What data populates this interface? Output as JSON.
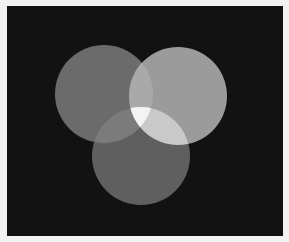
{
  "image": {
    "description": "Three overlapping translucent circles on a black background (grayscale color-mixing diagram)",
    "border_color": "#f2f2f2",
    "background_color": "#121212"
  },
  "panel": {
    "x": 7,
    "y": 6,
    "width": 276,
    "height": 230
  },
  "circles": [
    {
      "name": "left",
      "cx": 104,
      "cy": 94,
      "r": 49,
      "color": "#6b6b6b"
    },
    {
      "name": "right",
      "cx": 178,
      "cy": 96,
      "r": 49,
      "color": "#9b9b9b"
    },
    {
      "name": "bottom",
      "cx": 141,
      "cy": 156,
      "r": 49,
      "color": "#5f5f5f"
    }
  ],
  "overlaps": {
    "left_right": "#a9a9a9",
    "left_bottom": "#7b7b7b",
    "right_bottom": "#c9c9c9",
    "all_three": "#f3f3f3"
  }
}
